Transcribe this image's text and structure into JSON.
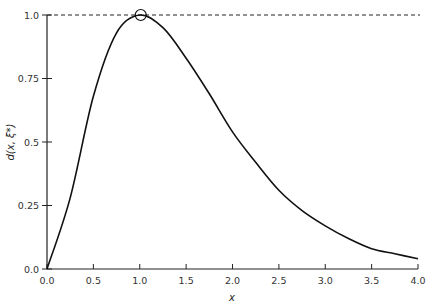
{
  "chart_data": {
    "type": "line",
    "title": "",
    "xlabel": "x",
    "ylabel": "d(x, ξ*)",
    "xlim": [
      0.0,
      4.0
    ],
    "ylim": [
      0.0,
      1.0
    ],
    "grid": false,
    "legend": null,
    "x_ticks": [
      "0.0",
      "0.5",
      "1.0",
      "1.5",
      "2.0",
      "2.5",
      "3.0",
      "3.5",
      "4.0"
    ],
    "y_ticks": [
      "0.0",
      "0.25",
      "0.5",
      "0.75",
      "1.0"
    ],
    "series": [
      {
        "name": "d(x, ξ*)",
        "style": "solid",
        "x": [
          0.0,
          0.25,
          0.5,
          0.75,
          1.0,
          1.25,
          1.5,
          1.75,
          2.0,
          2.25,
          2.5,
          2.75,
          3.0,
          3.25,
          3.5,
          3.75,
          4.0
        ],
        "values": [
          0.0,
          0.28,
          0.68,
          0.93,
          1.0,
          0.95,
          0.83,
          0.69,
          0.54,
          0.42,
          0.31,
          0.23,
          0.17,
          0.12,
          0.08,
          0.06,
          0.04
        ]
      },
      {
        "name": "reference line y = 1",
        "style": "dashed",
        "x": [
          0.0,
          4.0
        ],
        "values": [
          1.0,
          1.0
        ]
      }
    ],
    "annotations": [
      {
        "type": "open-circle-marker",
        "x": 1.0,
        "y": 1.0,
        "note": "maximum touches reference line"
      }
    ]
  }
}
